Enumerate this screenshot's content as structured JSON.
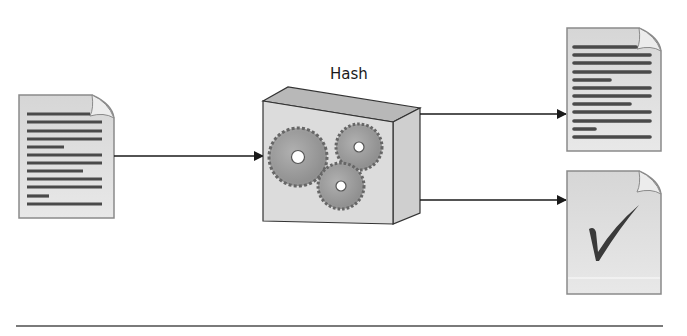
{
  "diagram": {
    "hash_label": "Hash",
    "nodes": [
      {
        "id": "input-document",
        "kind": "document",
        "content": "text-lines"
      },
      {
        "id": "hash-function",
        "kind": "box",
        "label": "Hash",
        "content": "gears"
      },
      {
        "id": "output-document",
        "kind": "document",
        "content": "text-lines"
      },
      {
        "id": "output-verified",
        "kind": "document",
        "content": "checkmark"
      }
    ],
    "edges": [
      {
        "from": "input-document",
        "to": "hash-function"
      },
      {
        "from": "hash-function",
        "to": "output-document"
      },
      {
        "from": "hash-function",
        "to": "output-verified"
      }
    ],
    "icons": {
      "input": "document-icon",
      "process": "gears-icon",
      "output_top": "document-icon",
      "output_bottom": "checkmark-document-icon"
    },
    "colors": {
      "doc_fill": "#e2e2e2",
      "doc_stroke": "#8a8a8a",
      "text_line": "#4a4a4a",
      "box_front": "#dcdcdc",
      "box_top": "#b8b8b8",
      "box_side": "#cfcfcf",
      "gear": "#9a9a9a",
      "arrow": "#1a1a1a",
      "rule": "#7a7a7a"
    }
  }
}
